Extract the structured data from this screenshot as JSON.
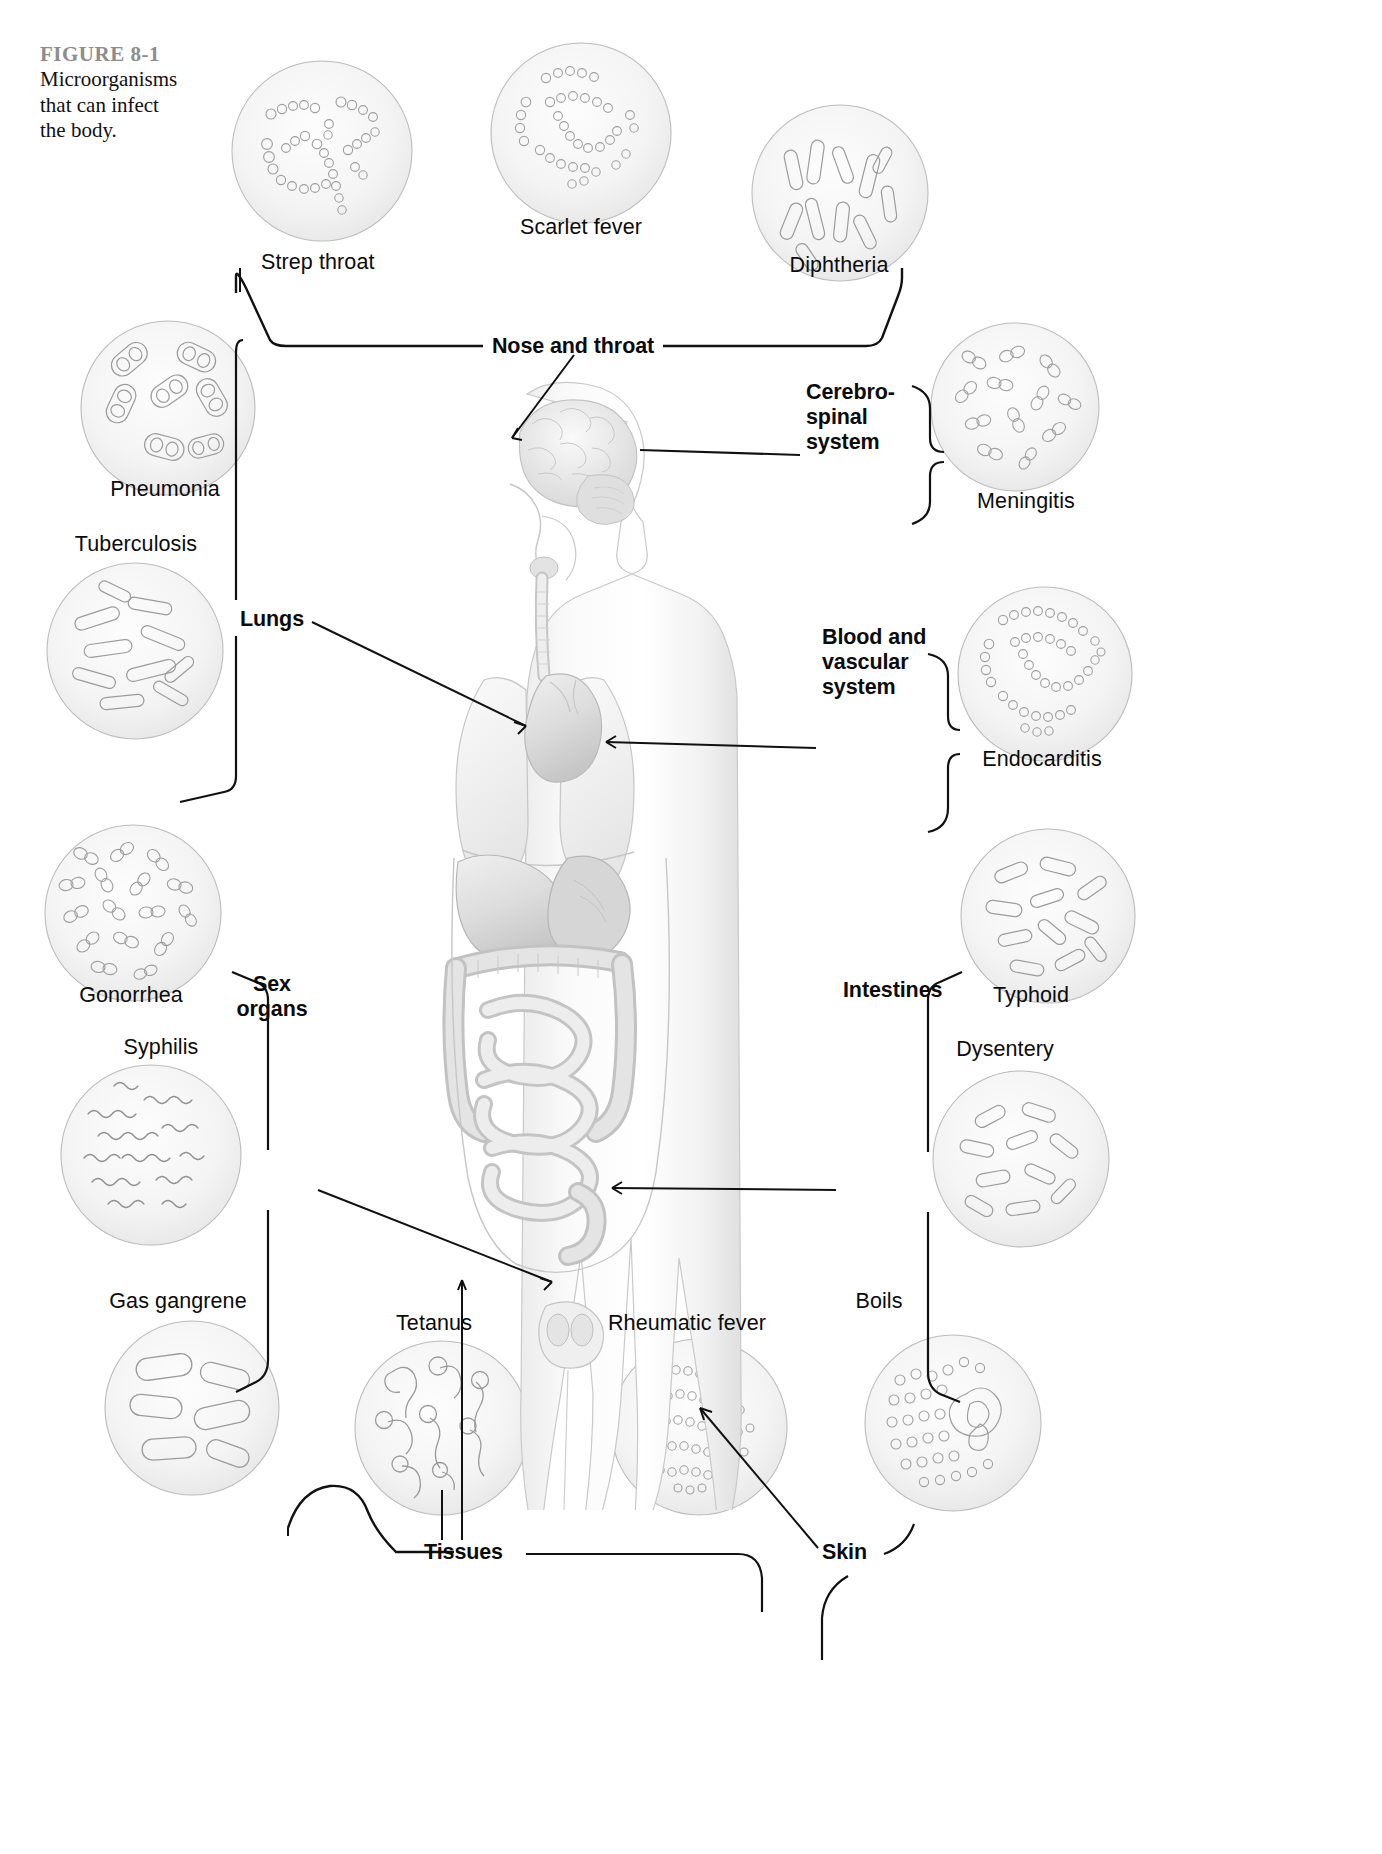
{
  "figure": {
    "number": "FIGURE 8-1",
    "caption": "Microorganisms\nthat can infect\nthe body."
  },
  "colors": {
    "ink": "#0b0b0b",
    "figure_number": "#8d8d8d",
    "dish_outline": "#b9b9b9",
    "dish_fill": "#f3f3f3",
    "microbe_outline": "#9a9a9a",
    "body_outline": "#bdbdbd",
    "organ_fill": "#d8d8d8",
    "connector": "#111111"
  },
  "diagram": {
    "type": "labeled-anatomical-diagram",
    "body_site_labels": [
      {
        "id": "nose-and-throat",
        "label": "Nose and throat",
        "x": 573,
        "y": 345,
        "align": "center",
        "bold": true
      },
      {
        "id": "cerebro-spinal-system",
        "label": "Cerebro-\nspinal\nsystem",
        "x": 806,
        "y": 455,
        "align": "left",
        "bold": true
      },
      {
        "id": "lungs",
        "label": "Lungs",
        "x": 240,
        "y": 617,
        "align": "left",
        "bold": true
      },
      {
        "id": "blood-and-vascular-system",
        "label": "Blood and\nvascular\nsystem",
        "x": 822,
        "y": 752,
        "align": "left",
        "bold": true
      },
      {
        "id": "sex-organs",
        "label": "Sex\norgans",
        "x": 272,
        "y": 1178,
        "align": "center",
        "bold": true
      },
      {
        "id": "intestines",
        "label": "Intestines",
        "x": 843,
        "y": 1189,
        "align": "left",
        "bold": true
      },
      {
        "id": "tissues",
        "label": "Tissues",
        "x": 463,
        "y": 1560,
        "align": "left",
        "bold": true
      },
      {
        "id": "skin",
        "label": "Skin",
        "x": 826,
        "y": 1560,
        "align": "left",
        "bold": true
      }
    ],
    "microbe_labels": [
      {
        "id": "strep-throat",
        "label": "Strep throat",
        "x": 261,
        "y": 250,
        "align": "left",
        "dish": "strep-throat-dish"
      },
      {
        "id": "scarlet-fever",
        "label": "Scarlet fever",
        "x": 581,
        "y": 215,
        "align": "center",
        "dish": "scarlet-fever-dish"
      },
      {
        "id": "diphtheria",
        "label": "Diphtheria",
        "x": 839,
        "y": 253,
        "align": "center",
        "dish": "diphtheria-dish"
      },
      {
        "id": "meningitis",
        "label": "Meningitis",
        "x": 1026,
        "y": 489,
        "align": "center",
        "dish": "meningitis-dish"
      },
      {
        "id": "pneumonia",
        "label": "Pneumonia",
        "x": 165,
        "y": 477,
        "align": "center",
        "dish": "pneumonia-dish"
      },
      {
        "id": "tuberculosis",
        "label": "Tuberculosis",
        "x": 136,
        "y": 532,
        "align": "center",
        "dish": "tuberculosis-dish"
      },
      {
        "id": "endocarditis",
        "label": "Endocarditis",
        "x": 1042,
        "y": 747,
        "align": "center",
        "dish": "endocarditis-dish"
      },
      {
        "id": "gonorrhea",
        "label": "Gonorrhea",
        "x": 131,
        "y": 983,
        "align": "center",
        "dish": "gonorrhea-dish"
      },
      {
        "id": "syphilis",
        "label": "Syphilis",
        "x": 161,
        "y": 1035,
        "align": "center",
        "dish": "syphilis-dish"
      },
      {
        "id": "typhoid",
        "label": "Typhoid",
        "x": 1031,
        "y": 983,
        "align": "center",
        "dish": "typhoid-dish"
      },
      {
        "id": "dysentery",
        "label": "Dysentery",
        "x": 1005,
        "y": 1037,
        "align": "center",
        "dish": "dysentery-dish"
      },
      {
        "id": "gas-gangrene",
        "label": "Gas gangrene",
        "x": 178,
        "y": 1289,
        "align": "center",
        "dish": "gas-gangrene-dish"
      },
      {
        "id": "tetanus",
        "label": "Tetanus",
        "x": 434,
        "y": 1311,
        "align": "center",
        "dish": "tetanus-dish"
      },
      {
        "id": "rheumatic-fever",
        "label": "Rheumatic fever",
        "x": 687,
        "y": 1311,
        "align": "center",
        "dish": "rheumatic-fever-dish"
      },
      {
        "id": "boils",
        "label": "Boils",
        "x": 879,
        "y": 1289,
        "align": "center",
        "dish": "boils-dish"
      }
    ],
    "groupings": [
      {
        "site": "Nose and throat",
        "diseases": [
          "Strep throat",
          "Scarlet fever",
          "Diphtheria"
        ]
      },
      {
        "site": "Cerebro-spinal system",
        "diseases": [
          "Meningitis"
        ]
      },
      {
        "site": "Lungs",
        "diseases": [
          "Pneumonia",
          "Tuberculosis"
        ]
      },
      {
        "site": "Blood and vascular system",
        "diseases": [
          "Endocarditis"
        ]
      },
      {
        "site": "Sex organs",
        "diseases": [
          "Gonorrhea",
          "Syphilis"
        ]
      },
      {
        "site": "Intestines",
        "diseases": [
          "Typhoid",
          "Dysentery"
        ]
      },
      {
        "site": "Tissues",
        "diseases": [
          "Gas gangrene",
          "Tetanus",
          "Rheumatic fever"
        ]
      },
      {
        "site": "Skin",
        "diseases": [
          "Boils"
        ]
      }
    ],
    "petri_dishes": [
      {
        "id": "strep-throat-dish",
        "x": 229,
        "y": 58,
        "size": 186,
        "morphology": "cocci-in-chains"
      },
      {
        "id": "scarlet-fever-dish",
        "x": 488,
        "y": 40,
        "size": 186,
        "morphology": "cocci-in-chains"
      },
      {
        "id": "diphtheria-dish",
        "x": 749,
        "y": 102,
        "size": 182,
        "morphology": "club-shaped-rods"
      },
      {
        "id": "pneumonia-dish",
        "x": 78,
        "y": 318,
        "size": 180,
        "morphology": "encapsulated-diplococci"
      },
      {
        "id": "meningitis-dish",
        "x": 928,
        "y": 320,
        "size": 174,
        "morphology": "diplococci"
      },
      {
        "id": "tuberculosis-dish",
        "x": 44,
        "y": 560,
        "size": 182,
        "morphology": "slender-rods"
      },
      {
        "id": "endocarditis-dish",
        "x": 955,
        "y": 584,
        "size": 180,
        "morphology": "cocci-in-chains"
      },
      {
        "id": "gonorrhea-dish",
        "x": 42,
        "y": 822,
        "size": 182,
        "morphology": "kidney-bean-diplococci"
      },
      {
        "id": "typhoid-dish",
        "x": 958,
        "y": 826,
        "size": 180,
        "morphology": "rods"
      },
      {
        "id": "syphilis-dish",
        "x": 58,
        "y": 1062,
        "size": 186,
        "morphology": "spirochetes"
      },
      {
        "id": "dysentery-dish",
        "x": 930,
        "y": 1068,
        "size": 182,
        "morphology": "rods"
      },
      {
        "id": "gas-gangrene-dish",
        "x": 102,
        "y": 1318,
        "size": 180,
        "morphology": "large-rods"
      },
      {
        "id": "tetanus-dish",
        "x": 352,
        "y": 1338,
        "size": 180,
        "morphology": "drumstick-rods"
      },
      {
        "id": "rheumatic-fever-dish",
        "x": 608,
        "y": 1336,
        "size": 182,
        "morphology": "cocci-clusters"
      },
      {
        "id": "boils-dish",
        "x": 862,
        "y": 1332,
        "size": 182,
        "morphology": "cocci-with-phagocyte"
      }
    ]
  }
}
